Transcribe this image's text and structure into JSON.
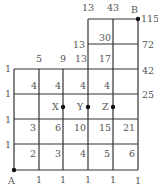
{
  "diagram": {
    "type": "grid-path-count",
    "points": {
      "A": {
        "label": "A",
        "x": 14,
        "y": 170
      },
      "B": {
        "label": "B",
        "x": 138,
        "y": 19
      },
      "X": {
        "label": "X",
        "x": 63,
        "y": 107
      },
      "Y": {
        "label": "Y",
        "x": 88,
        "y": 107
      },
      "Z": {
        "label": "Z",
        "x": 113,
        "y": 107
      }
    },
    "labels": [
      {
        "id": "top-13a",
        "text": "13",
        "x": 88,
        "y": 11,
        "anchor": "middle"
      },
      {
        "id": "top-43",
        "text": "43",
        "x": 113,
        "y": 11,
        "anchor": "middle"
      },
      {
        "id": "r1-115",
        "text": "115",
        "x": 141,
        "y": 22,
        "anchor": "start"
      },
      {
        "id": "r2-30",
        "text": "30",
        "x": 105,
        "y": 41,
        "anchor": "middle"
      },
      {
        "id": "r2-13",
        "text": "13",
        "x": 85,
        "y": 48,
        "anchor": "end"
      },
      {
        "id": "r2-72",
        "text": "72",
        "x": 142,
        "y": 48,
        "anchor": "start"
      },
      {
        "id": "r3-5",
        "text": "5",
        "x": 39,
        "y": 62,
        "anchor": "middle"
      },
      {
        "id": "r3-9",
        "text": "9",
        "x": 63,
        "y": 62,
        "anchor": "middle"
      },
      {
        "id": "r3-13",
        "text": "13",
        "x": 81,
        "y": 62,
        "anchor": "middle"
      },
      {
        "id": "r3-17",
        "text": "17",
        "x": 105,
        "y": 62,
        "anchor": "middle"
      },
      {
        "id": "r3-1",
        "text": "1",
        "x": 8,
        "y": 72,
        "anchor": "middle"
      },
      {
        "id": "r3-42",
        "text": "42",
        "x": 142,
        "y": 74,
        "anchor": "start"
      },
      {
        "id": "r4-4a",
        "text": "4",
        "x": 34,
        "y": 89,
        "anchor": "middle"
      },
      {
        "id": "r4-4b",
        "text": "4",
        "x": 58,
        "y": 89,
        "anchor": "middle"
      },
      {
        "id": "r4-4c",
        "text": "4",
        "x": 83,
        "y": 89,
        "anchor": "middle"
      },
      {
        "id": "r4-4d",
        "text": "4",
        "x": 107,
        "y": 89,
        "anchor": "middle"
      },
      {
        "id": "r4-1",
        "text": "1",
        "x": 8,
        "y": 97,
        "anchor": "middle"
      },
      {
        "id": "r4-25",
        "text": "25",
        "x": 142,
        "y": 98,
        "anchor": "start"
      },
      {
        "id": "r6-3",
        "text": "3",
        "x": 33,
        "y": 131,
        "anchor": "middle"
      },
      {
        "id": "r6-6",
        "text": "6",
        "x": 58,
        "y": 131,
        "anchor": "middle"
      },
      {
        "id": "r6-10",
        "text": "10",
        "x": 80,
        "y": 131,
        "anchor": "middle"
      },
      {
        "id": "r6-15",
        "text": "15",
        "x": 105,
        "y": 131,
        "anchor": "middle"
      },
      {
        "id": "r6-21",
        "text": "21",
        "x": 129,
        "y": 131,
        "anchor": "middle"
      },
      {
        "id": "r6-1",
        "text": "1",
        "x": 8,
        "y": 123,
        "anchor": "middle"
      },
      {
        "id": "r7-2",
        "text": "2",
        "x": 33,
        "y": 157,
        "anchor": "middle"
      },
      {
        "id": "r7-3",
        "text": "3",
        "x": 58,
        "y": 157,
        "anchor": "middle"
      },
      {
        "id": "r7-4",
        "text": "4",
        "x": 83,
        "y": 157,
        "anchor": "middle"
      },
      {
        "id": "r7-5",
        "text": "5",
        "x": 107,
        "y": 157,
        "anchor": "middle"
      },
      {
        "id": "r7-6",
        "text": "6",
        "x": 132,
        "y": 157,
        "anchor": "middle"
      },
      {
        "id": "r7-1",
        "text": "1",
        "x": 8,
        "y": 148,
        "anchor": "middle"
      },
      {
        "id": "b-1a",
        "text": "1",
        "x": 39,
        "y": 183,
        "anchor": "middle"
      },
      {
        "id": "b-1b",
        "text": "1",
        "x": 63,
        "y": 183,
        "anchor": "middle"
      },
      {
        "id": "b-1c",
        "text": "1",
        "x": 88,
        "y": 183,
        "anchor": "middle"
      },
      {
        "id": "b-1d",
        "text": "1",
        "x": 113,
        "y": 183,
        "anchor": "middle"
      },
      {
        "id": "b-1e",
        "text": "1",
        "x": 138,
        "y": 184,
        "anchor": "middle"
      }
    ]
  }
}
